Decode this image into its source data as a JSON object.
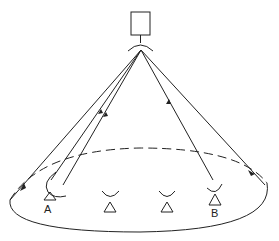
{
  "diagram": {
    "type": "satellite-broadcast-coverage",
    "satellite": {
      "label": ""
    },
    "ground_stations": [
      {
        "id": "A",
        "label": "A"
      },
      {
        "id": "2",
        "label": ""
      },
      {
        "id": "3",
        "label": ""
      },
      {
        "id": "B",
        "label": "B"
      }
    ],
    "labels": {
      "station_a": "A",
      "station_b": "B"
    },
    "colors": {
      "stroke": "#222222",
      "background": "#ffffff"
    }
  }
}
